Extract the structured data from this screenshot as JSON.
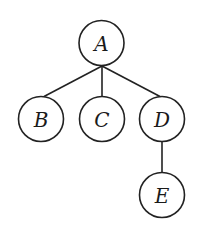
{
  "diagram": {
    "type": "tree",
    "stroke_color": "#222222",
    "node_radius": 22.5,
    "nodes": [
      {
        "id": "A",
        "label": "A",
        "cx": 101.5,
        "cy": 43
      },
      {
        "id": "B",
        "label": "B",
        "cx": 41,
        "cy": 119
      },
      {
        "id": "C",
        "label": "C",
        "cx": 102,
        "cy": 119
      },
      {
        "id": "D",
        "label": "D",
        "cx": 162,
        "cy": 119
      },
      {
        "id": "E",
        "label": "E",
        "cx": 162,
        "cy": 195
      }
    ],
    "edges": [
      {
        "from": "A",
        "to": "B",
        "x1": 102,
        "y1": 66,
        "x2": 44,
        "y2": 96.5
      },
      {
        "from": "A",
        "to": "C",
        "x1": 102,
        "y1": 66,
        "x2": 102,
        "y2": 96.5
      },
      {
        "from": "A",
        "to": "D",
        "x1": 102,
        "y1": 66,
        "x2": 160,
        "y2": 96.5
      },
      {
        "from": "D",
        "to": "E",
        "x1": 162,
        "y1": 141.5,
        "x2": 162,
        "y2": 172.5
      }
    ]
  }
}
